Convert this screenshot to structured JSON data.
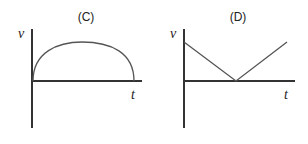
{
  "panels": [
    {
      "label": "(C)",
      "y_axis_label": "v",
      "x_axis_label": "t",
      "curve_type": "semicircle-arc",
      "description": "velocity rises from zero to a maximum then falls back to zero"
    },
    {
      "label": "(D)",
      "y_axis_label": "v",
      "x_axis_label": "t",
      "curve_type": "v-shape",
      "description": "velocity decreases linearly to zero then increases linearly"
    }
  ],
  "colors": {
    "axis": "#333333",
    "curve": "#555555",
    "text": "#222222"
  }
}
